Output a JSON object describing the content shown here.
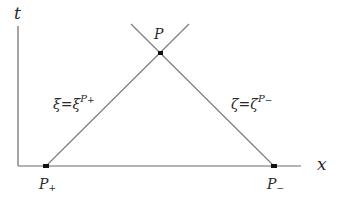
{
  "diagram": {
    "axes": {
      "t_label": "t",
      "x_label": "x"
    },
    "points": {
      "apex": {
        "label": "P"
      },
      "left_base": {
        "label_main": "P",
        "label_sub": "+"
      },
      "right_base": {
        "label_main": "P",
        "label_sub": "−"
      }
    },
    "line_labels": {
      "left": {
        "lhs": "ξ",
        "eq": "=",
        "rhs": "ξ",
        "sup_main": "P",
        "sup_sub": "+"
      },
      "right": {
        "lhs": "ζ",
        "eq": "=",
        "rhs": "ζ",
        "sup_main": "P",
        "sup_sub": "−"
      }
    },
    "colors": {
      "line": "#7a7a7a",
      "axis": "#6a6a6a",
      "point": "#111111",
      "text": "#2a2a2a"
    }
  }
}
